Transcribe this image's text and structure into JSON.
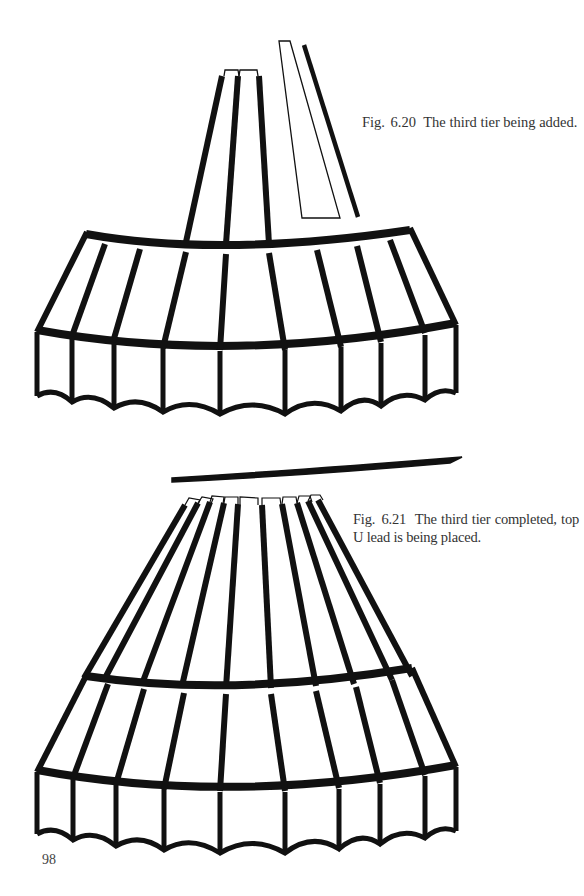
{
  "page": {
    "number": "98"
  },
  "figures": [
    {
      "id": "fig-6-20",
      "label": "Fig. 6.20",
      "caption": "The third tier being added."
    },
    {
      "id": "fig-6-21",
      "label": "Fig. 6.21",
      "caption": "The third tier completed, top U lead is being placed."
    }
  ],
  "colors": {
    "lead": "#111111",
    "paper": "#ffffff",
    "text": "#333333"
  }
}
